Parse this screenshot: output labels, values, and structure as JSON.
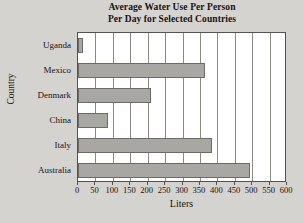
{
  "chart_data": {
    "type": "bar",
    "orientation": "horizontal",
    "title": "Average Water Use Per Person Per Day for Selected Countries",
    "title_lines": [
      "Average Water Use Per Person",
      "Per Day for Selected Countries"
    ],
    "xlabel": "Liters",
    "ylabel": "Country",
    "categories": [
      "Uganda",
      "Mexico",
      "Denmark",
      "China",
      "Italy",
      "Australia"
    ],
    "values": [
      15,
      366,
      209,
      86,
      386,
      493
    ],
    "xlim": [
      0,
      600
    ],
    "xticks": [
      0,
      50,
      100,
      150,
      200,
      250,
      300,
      350,
      400,
      450,
      500,
      550,
      600
    ],
    "xtick_labels": [
      "0",
      "50",
      "100",
      "150",
      "200",
      "250",
      "300",
      "350",
      "400",
      "450",
      "500",
      "550",
      "600"
    ],
    "grid": "vertical",
    "legend": null,
    "colors": {
      "bar_fill": "#a9a7a3",
      "bar_border": "#6e6b66",
      "plot_background": "#ffffff",
      "figure_background": "#d5d3cf",
      "gridline": "#8d8a85",
      "axis": "#55524d",
      "text": "#16120f"
    }
  }
}
